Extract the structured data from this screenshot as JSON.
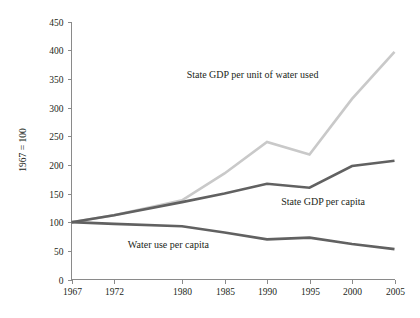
{
  "chart_data": {
    "type": "line",
    "title": "",
    "subtitle": "",
    "xlabel": "",
    "ylabel": "1967 = 100",
    "x": [
      1967,
      1972,
      1980,
      1985,
      1990,
      1995,
      2000,
      2005
    ],
    "xtick_labels": [
      "1967",
      "1972",
      "1980",
      "1985",
      "1990",
      "1995",
      "2000",
      "2005"
    ],
    "xlim": [
      1967,
      2005
    ],
    "ylim": [
      0,
      450
    ],
    "ytick_labels": [
      "0",
      "50",
      "100",
      "150",
      "200",
      "250",
      "300",
      "350",
      "400",
      "450"
    ],
    "ytick_values": [
      0,
      50,
      100,
      150,
      200,
      250,
      300,
      350,
      400,
      450
    ],
    "grid": false,
    "legend_position": "inline-annotations",
    "series": [
      {
        "name": "State GDP per unit of water used",
        "color": "#c9c9c9",
        "width": 2.6,
        "values": [
          100,
          112,
          138,
          185,
          240,
          218,
          315,
          397
        ],
        "annotation": {
          "text": "State GDP per unit of water used",
          "x": 1988.3,
          "y": 352
        }
      },
      {
        "name": "State GDP per capita",
        "color": "#616161",
        "width": 2.6,
        "values": [
          100,
          112,
          135,
          150,
          167,
          160,
          198,
          207
        ],
        "annotation": {
          "text": "State GDP per capita",
          "x": 1996.6,
          "y": 130
        }
      },
      {
        "name": "Water use per capita",
        "color": "#616161",
        "width": 2.6,
        "values": [
          100,
          97,
          93,
          82,
          70,
          73,
          62,
          53
        ],
        "annotation": {
          "text": "Water use per capita",
          "x": 1978.4,
          "y": 55
        }
      }
    ]
  }
}
